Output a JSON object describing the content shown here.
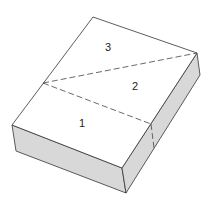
{
  "diagram": {
    "type": "box-isometric",
    "labels": [
      {
        "id": "region-1",
        "text": "1",
        "x": 82,
        "y": 127
      },
      {
        "id": "region-2",
        "text": "2",
        "x": 135,
        "y": 90
      },
      {
        "id": "region-3",
        "text": "3",
        "x": 108,
        "y": 51
      }
    ],
    "colors": {
      "top_face": "#ffffff",
      "side_face": "#d8d8d8",
      "edge": "#333333",
      "dash": "#444444"
    }
  }
}
